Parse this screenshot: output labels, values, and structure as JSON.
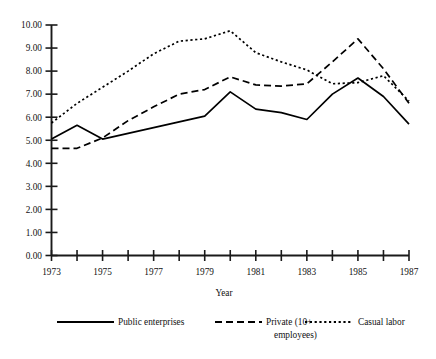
{
  "chart_data": {
    "type": "line",
    "title": "",
    "xlabel": "Year",
    "ylabel": "",
    "grid": false,
    "legend_position": "bottom",
    "xlim": [
      1973,
      1987
    ],
    "ylim": [
      0.0,
      10.0
    ],
    "x": [
      1973,
      1974,
      1975,
      1976,
      1977,
      1978,
      1979,
      1980,
      1981,
      1982,
      1983,
      1984,
      1985,
      1986,
      1987
    ],
    "x_tick_labels": [
      "1973",
      "",
      "1975",
      "",
      "1977",
      "",
      "1979",
      "",
      "1981",
      "",
      "1983",
      "",
      "1985",
      "",
      "1987"
    ],
    "y_tick_labels": [
      "0.00",
      "1.00",
      "2.00",
      "3.00",
      "4.00",
      "5.00",
      "6.00",
      "7.00",
      "8.00",
      "9.00",
      "10.00"
    ],
    "y_ticks": [
      0,
      1,
      2,
      3,
      4,
      5,
      6,
      7,
      8,
      9,
      10
    ],
    "series": [
      {
        "name": "Public enterprises",
        "style": "solid",
        "color": "#000000",
        "values": [
          5.05,
          5.65,
          5.05,
          5.3,
          5.55,
          5.8,
          6.05,
          7.1,
          6.35,
          6.2,
          5.9,
          7.0,
          7.7,
          6.9,
          5.7
        ]
      },
      {
        "name": "Private (10+ employees)",
        "style": "dashed",
        "color": "#000000",
        "values": [
          4.65,
          4.65,
          5.1,
          5.85,
          6.45,
          7.0,
          7.2,
          7.75,
          7.4,
          7.35,
          7.45,
          8.4,
          9.4,
          8.1,
          6.6
        ]
      },
      {
        "name": "Casual labor",
        "style": "dotted",
        "color": "#000000",
        "values": [
          5.75,
          6.6,
          7.3,
          8.0,
          8.75,
          9.3,
          9.4,
          9.75,
          8.8,
          8.4,
          8.05,
          7.45,
          7.5,
          7.8,
          6.7
        ]
      }
    ]
  },
  "axes": {
    "x_axis_title": "Year"
  },
  "legend": {
    "entries": [
      {
        "label": "Public enterprises",
        "style": "solid"
      },
      {
        "label": "Private (10+",
        "label_line2": "employees)",
        "style": "dashed"
      },
      {
        "label": "Casual labor",
        "style": "dotted"
      }
    ]
  }
}
